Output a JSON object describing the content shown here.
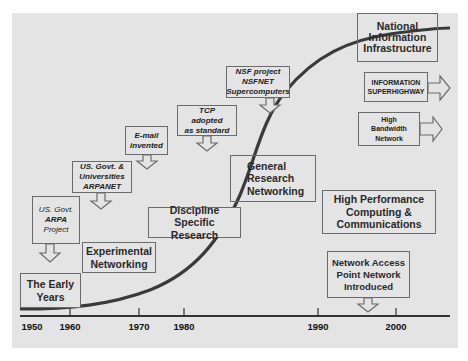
{
  "diagram": {
    "type": "s-curve-timeline",
    "colors": {
      "background": "#e4e4e4",
      "curve": "#3a3a3a",
      "box_border": "#6b6b6b",
      "text": "#222222"
    },
    "axis": {
      "years": [
        "1950",
        "1960",
        "1970",
        "1980",
        "1990",
        "2000"
      ]
    },
    "phases": [
      {
        "id": "early",
        "label_lines": [
          "The Early",
          "Years"
        ]
      },
      {
        "id": "experimental",
        "label_lines": [
          "Experimental",
          "Networking"
        ]
      },
      {
        "id": "discipline",
        "label_lines": [
          "Discipline Specific",
          "Research"
        ]
      },
      {
        "id": "general",
        "label_lines": [
          "General",
          "Research",
          "Networking"
        ]
      },
      {
        "id": "hpcc",
        "label_lines": [
          "High Performance",
          "Computing &",
          "Communications"
        ]
      },
      {
        "id": "nii",
        "label_lines": [
          "National",
          "Information",
          "Infrastructure"
        ]
      }
    ],
    "milestones": [
      {
        "id": "arpa",
        "lines": [
          "US. Govt.",
          "ARPA",
          "Project"
        ]
      },
      {
        "id": "arpanet",
        "lines": [
          "US. Govt. &",
          "Universities",
          "ARPANET"
        ]
      },
      {
        "id": "email",
        "lines": [
          "E-mail",
          "invented"
        ]
      },
      {
        "id": "tcp",
        "lines": [
          "TCP",
          "adopted",
          "as standard"
        ]
      },
      {
        "id": "nsfnet",
        "lines": [
          "NSF project",
          "NSFNET",
          "Supercomputers"
        ]
      },
      {
        "id": "nap",
        "lines": [
          "Network Access",
          "Point Network",
          "Introduced"
        ]
      }
    ],
    "outcomes": [
      {
        "id": "superhighway",
        "lines": [
          "INFORMATION",
          "SUPERHIGHWAY"
        ]
      },
      {
        "id": "bandwidth",
        "lines": [
          "High",
          "Bandwidth",
          "Network"
        ]
      }
    ]
  }
}
